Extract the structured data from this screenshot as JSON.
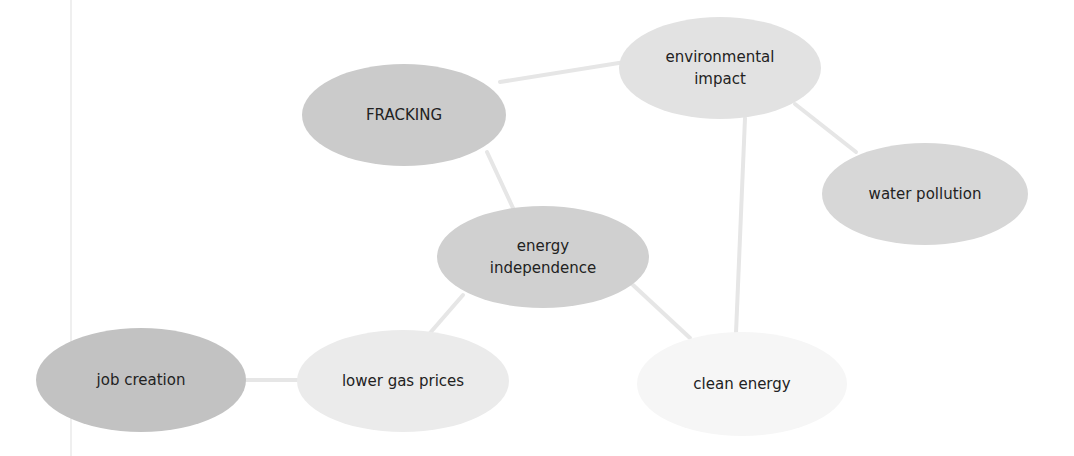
{
  "diagram": {
    "type": "concept-map",
    "nodes": [
      {
        "id": "fracking",
        "label": "FRACKING",
        "cx": 404,
        "cy": 115,
        "rx": 102,
        "ry": 51,
        "fill": "#cbcbcb"
      },
      {
        "id": "environmental-impact",
        "label": "environmental impact",
        "cx": 720,
        "cy": 68,
        "rx": 101,
        "ry": 51,
        "fill": "#e2e2e2"
      },
      {
        "id": "water-pollution",
        "label": "water pollution",
        "cx": 925,
        "cy": 194,
        "rx": 103,
        "ry": 51,
        "fill": "#d7d7d7"
      },
      {
        "id": "energy-independence",
        "label": "energy independence",
        "cx": 543,
        "cy": 257,
        "rx": 106,
        "ry": 51,
        "fill": "#d0d0d0"
      },
      {
        "id": "job-creation",
        "label": "job creation",
        "cx": 141,
        "cy": 380,
        "rx": 105,
        "ry": 52,
        "fill": "#c2c2c2"
      },
      {
        "id": "lower-gas-prices",
        "label": "lower gas prices",
        "cx": 403,
        "cy": 381,
        "rx": 106,
        "ry": 51,
        "fill": "#ebebeb"
      },
      {
        "id": "clean-energy",
        "label": "clean energy",
        "cx": 742,
        "cy": 384,
        "rx": 105,
        "ry": 52,
        "fill": "#f6f6f6"
      }
    ],
    "edges": [
      {
        "from": "fracking",
        "to": "environmental-impact",
        "x1": 500,
        "y1": 82,
        "x2": 625,
        "y2": 62
      },
      {
        "from": "fracking",
        "to": "energy-independence",
        "x1": 487,
        "y1": 152,
        "x2": 513,
        "y2": 208
      },
      {
        "from": "environmental-impact",
        "to": "water-pollution",
        "x1": 795,
        "y1": 104,
        "x2": 856,
        "y2": 152
      },
      {
        "from": "environmental-impact",
        "to": "clean-energy",
        "x1": 745,
        "y1": 118,
        "x2": 736,
        "y2": 333
      },
      {
        "from": "energy-independence",
        "to": "clean-energy",
        "x1": 633,
        "y1": 285,
        "x2": 690,
        "y2": 338
      },
      {
        "from": "energy-independence",
        "to": "lower-gas-prices",
        "x1": 463,
        "y1": 295,
        "x2": 430,
        "y2": 333
      },
      {
        "from": "job-creation",
        "to": "lower-gas-prices",
        "x1": 246,
        "y1": 380,
        "x2": 298,
        "y2": 380
      }
    ]
  }
}
